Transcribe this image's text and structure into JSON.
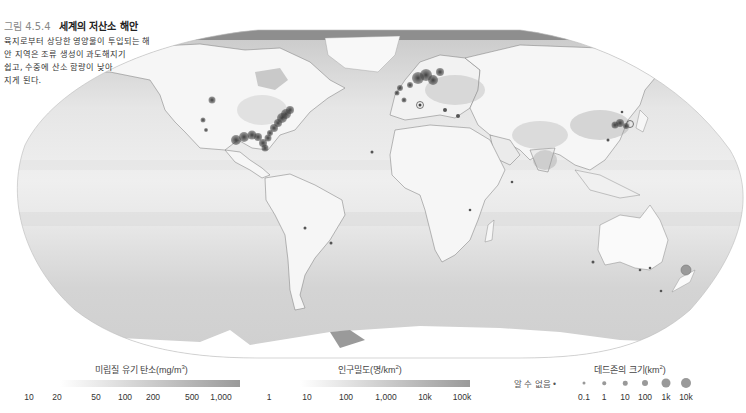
{
  "figure": {
    "number": "그림 4.5.4",
    "title": "세계의 저산소 해안",
    "description_lines": [
      "육지로부터 상당한 영양물이 투입되는 해",
      "안 지역은 조류 생성이 과도해지기",
      "쉽고, 수중에 산소 함량이 낮아",
      "지게 된다."
    ]
  },
  "map": {
    "projection": "Robinson",
    "ocean_color_light": "#efefef",
    "ocean_color_dark": "#c4c4c4",
    "land_color": "#f6f6f6",
    "border_color": "#6a6a6a",
    "deadzone_color": "#3a3a3a"
  },
  "legends": {
    "carbon": {
      "title": "미립질 유기 탄소(mg/m",
      "title_sup": "3",
      "title_end": ")",
      "ticks": [
        "10",
        "20",
        "50",
        "100",
        "200",
        "500",
        "1,000"
      ],
      "gradient_start": "#ffffff",
      "gradient_end": "#9a9a9a"
    },
    "population": {
      "title": "인구밀도(명/km",
      "title_sup": "2",
      "title_end": ")",
      "ticks": [
        "1",
        "10",
        "100",
        "1,000",
        "10k",
        "100k"
      ],
      "gradient_start": "#ffffff",
      "gradient_end": "#9a9a9a"
    },
    "deadzone": {
      "title": "데드존의 크기(km",
      "title_sup": "2",
      "title_end": ")",
      "unknown_label": "알 수 없음",
      "ticks": [
        "0.1",
        "1",
        "10",
        "100",
        "1k",
        "10k"
      ],
      "dot_sizes": [
        3,
        3.5,
        4.5,
        6,
        9,
        10
      ]
    }
  }
}
